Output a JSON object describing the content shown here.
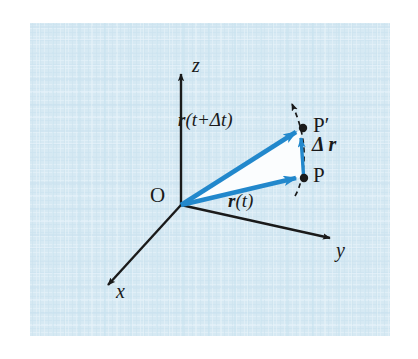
{
  "figure": {
    "background_color": "#d6e9f3",
    "page_color": "#ffffff",
    "vector_color": "#2288cc",
    "axis_color": "#1a1a1a",
    "text_color": "#1a1a1a",
    "triangle_fill": "#fbfdfe",
    "plate": {
      "x": 30,
      "y": 23,
      "width": 360,
      "height": 313
    }
  },
  "axes": [
    {
      "name": "z",
      "label": "z",
      "label_x": 192,
      "label_y": 63
    },
    {
      "name": "y",
      "label": "y",
      "label_x": 338,
      "label_y": 248
    },
    {
      "name": "x",
      "label": "x",
      "label_x": 116,
      "label_y": 290
    }
  ],
  "origin": {
    "label": "O",
    "label_x": 152,
    "label_y": 192,
    "x": 181,
    "y": 205
  },
  "points": [
    {
      "name": "P",
      "label": "P",
      "label_x": 313,
      "label_y": 167,
      "x": 304,
      "y": 178
    },
    {
      "name": "P-prime",
      "label": "P′",
      "label_x": 313,
      "label_y": 117,
      "x": 303,
      "y": 128
    }
  ],
  "vectors": [
    {
      "name": "r-of-t",
      "label": "r(t)",
      "label_symbol": "r",
      "label_rest": "(t)",
      "label_x": 231,
      "label_y": 199,
      "from": [
        181,
        205
      ],
      "to": [
        300,
        177
      ]
    },
    {
      "name": "r-of-t-plus-delta-t",
      "label": "r(t+Δt)",
      "label_symbol": "r",
      "label_rest": "(t+Δt)",
      "label_x": 186,
      "label_y": 119,
      "from": [
        181,
        205
      ],
      "to": [
        299,
        130
      ]
    },
    {
      "name": "delta-r",
      "label": "Δr",
      "label_symbol": "Δ r",
      "label_x": 313,
      "label_y": 141,
      "from": [
        303,
        176
      ],
      "to": [
        300,
        132
      ]
    }
  ],
  "trajectory": {
    "name": "particle-path",
    "style": "dashed",
    "arrow": "up"
  }
}
